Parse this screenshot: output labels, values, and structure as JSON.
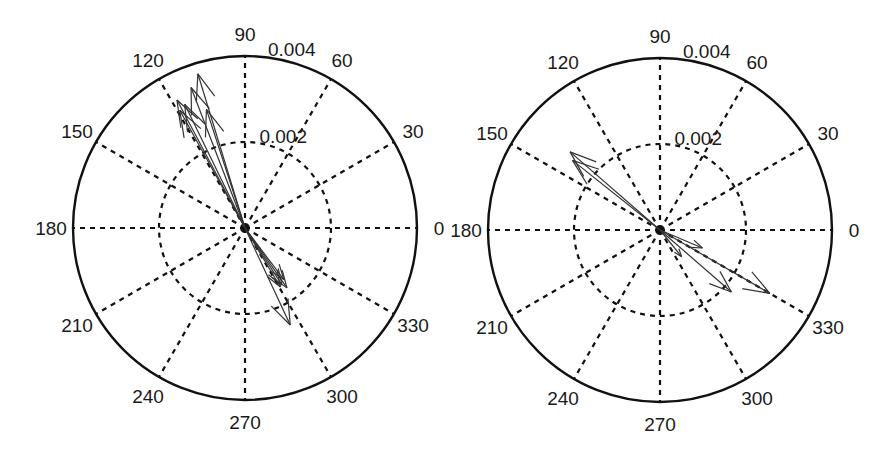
{
  "chart_data": [
    {
      "type": "compass",
      "title": "",
      "panel": "left",
      "center_px": [
        245,
        228
      ],
      "radius_px": 172,
      "r_max": 0.004,
      "r_ticks": [
        0.002,
        0.004
      ],
      "r_tick_labels": [
        "0.002",
        "0.004"
      ],
      "theta_ticks_deg": [
        0,
        30,
        60,
        90,
        120,
        150,
        180,
        210,
        240,
        270,
        300,
        330
      ],
      "theta_tick_labels": [
        "0",
        "30",
        "60",
        "90",
        "120",
        "150",
        "180",
        "210",
        "240",
        "270",
        "300",
        "330"
      ],
      "grid": true,
      "arrows": [
        {
          "angle_deg": 107,
          "magnitude": 0.00375
        },
        {
          "angle_deg": 111,
          "magnitude": 0.0035
        },
        {
          "angle_deg": 118,
          "magnitude": 0.00337
        },
        {
          "angle_deg": 119,
          "magnitude": 0.00313
        },
        {
          "angle_deg": 108,
          "magnitude": 0.0029
        },
        {
          "angle_deg": 116,
          "magnitude": 0.0032
        },
        {
          "angle_deg": 305,
          "magnitude": 0.0017
        },
        {
          "angle_deg": 303,
          "magnitude": 0.00158
        },
        {
          "angle_deg": 301,
          "magnitude": 0.0016
        },
        {
          "angle_deg": 295,
          "magnitude": 0.00249
        },
        {
          "angle_deg": 307,
          "magnitude": 0.0015
        }
      ]
    },
    {
      "type": "compass",
      "title": "",
      "panel": "right",
      "center_px": [
        660,
        230
      ],
      "radius_px": 172,
      "r_max": 0.004,
      "r_ticks": [
        0.002,
        0.004
      ],
      "r_tick_labels": [
        "0.002",
        "0.004"
      ],
      "theta_ticks_deg": [
        0,
        30,
        60,
        90,
        120,
        150,
        180,
        210,
        240,
        270,
        300,
        330
      ],
      "theta_tick_labels": [
        "0",
        "30",
        "60",
        "90",
        "120",
        "150",
        "180",
        "210",
        "240",
        "270",
        "300",
        "330"
      ],
      "grid": true,
      "arrows": [
        {
          "angle_deg": 139,
          "magnitude": 0.00277
        },
        {
          "angle_deg": 141.5,
          "magnitude": 0.0026
        },
        {
          "angle_deg": 330,
          "magnitude": 0.00295
        },
        {
          "angle_deg": 319,
          "magnitude": 0.0022
        },
        {
          "angle_deg": 337,
          "magnitude": 0.00107
        },
        {
          "angle_deg": 309,
          "magnitude": 0.0008
        }
      ]
    }
  ],
  "style": {
    "line_color": "#111111",
    "arrow_color": "#333333",
    "grid_color": "#111111",
    "background": "#ffffff"
  }
}
